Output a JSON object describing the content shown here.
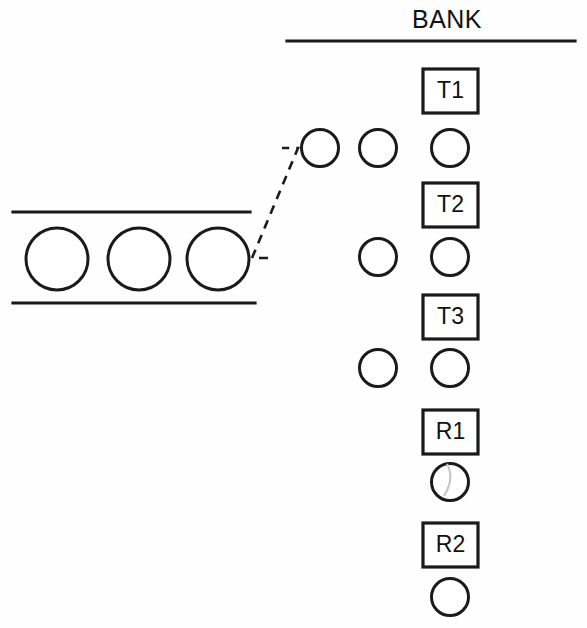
{
  "diagram": {
    "title": "BANK",
    "background_color": "#fefefe",
    "stroke_color": "#1a1a1a",
    "artifact_color": "#c9c9c9",
    "bank": {
      "title": "BANK",
      "title_x": 447,
      "title_y": 21,
      "underline": {
        "x1": 287,
        "y1": 41,
        "x2": 575,
        "y2": 41
      },
      "slots": [
        {
          "label": "T1",
          "square": {
            "x": 423,
            "y": 69,
            "width": 55,
            "height": 44
          },
          "circle": {
            "cx": 450,
            "cy": 148,
            "r": 18.5
          },
          "has_artifact_arc": false
        },
        {
          "label": "T2",
          "square": {
            "x": 423,
            "y": 183,
            "width": 55,
            "height": 44
          },
          "circle": {
            "cx": 450,
            "cy": 257,
            "r": 18.5
          },
          "has_artifact_arc": false
        },
        {
          "label": "T3",
          "square": {
            "x": 423,
            "y": 295,
            "width": 55,
            "height": 44
          },
          "circle": {
            "cx": 450,
            "cy": 368,
            "r": 18.5
          },
          "has_artifact_arc": false
        },
        {
          "label": "R1",
          "square": {
            "x": 423,
            "y": 410,
            "width": 55,
            "height": 44
          },
          "circle": {
            "cx": 450,
            "cy": 482,
            "r": 18.5
          },
          "has_artifact_arc": true
        },
        {
          "label": "R2",
          "square": {
            "x": 423,
            "y": 523,
            "width": 55,
            "height": 44
          },
          "circle": {
            "cx": 450,
            "cy": 597,
            "r": 18.5
          },
          "has_artifact_arc": false
        }
      ],
      "staged_circles": [
        {
          "cx": 378,
          "cy": 148,
          "r": 18.5
        },
        {
          "cx": 378,
          "cy": 257,
          "r": 18.5
        },
        {
          "cx": 378,
          "cy": 368,
          "r": 18.5
        },
        {
          "cx": 320,
          "cy": 148,
          "r": 18.5
        }
      ]
    },
    "tray": {
      "top_rule": {
        "x1": 13,
        "y1": 212,
        "x2": 250,
        "y2": 212
      },
      "bottom_rule": {
        "x1": 13,
        "y1": 303,
        "x2": 255,
        "y2": 303
      },
      "circles": [
        {
          "cx": 57,
          "cy": 259,
          "r": 31
        },
        {
          "cx": 139,
          "cy": 259,
          "r": 31
        },
        {
          "cx": 218,
          "cy": 259,
          "r": 31
        }
      ]
    },
    "leader": {
      "path": "M 268 258 L 253 258 L 253 256 L 298 148 L 283 148",
      "dash_pattern": "9 7"
    }
  }
}
